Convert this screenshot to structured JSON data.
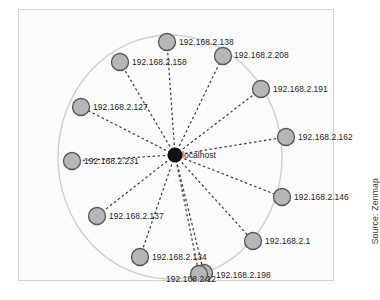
{
  "figure": {
    "type": "network-topology",
    "tool": "Zenmap",
    "source_note": "Source: Zenmap",
    "center": {
      "label": "localhost",
      "x": 157,
      "y": 146,
      "radius": 7.5,
      "color": "#111111"
    },
    "ring": {
      "center_x": 152,
      "center_y": 148,
      "radius_x": 112,
      "radius_y": 122,
      "stroke": "#cfcfcf"
    },
    "node_style": {
      "fill": "#b6b6b6",
      "stroke": "#555555",
      "radius": 8.5
    },
    "link_style": {
      "stroke": "#3a3a3a",
      "dash": "2.5,2.5",
      "width": 1.2
    },
    "hosts": [
      {
        "label": "192.168.2.138",
        "x": 149,
        "y": 33,
        "lx": 161,
        "ly": 29
      },
      {
        "label": "192.168.2.208",
        "x": 205,
        "y": 47,
        "lx": 216,
        "ly": 42
      },
      {
        "label": "192.168.2.191",
        "x": 243,
        "y": 80,
        "lx": 255,
        "ly": 76
      },
      {
        "label": "192.168.2.162",
        "x": 268,
        "y": 128,
        "lx": 280,
        "ly": 124
      },
      {
        "label": "192.168.2.146",
        "x": 264,
        "y": 188,
        "lx": 276,
        "ly": 184
      },
      {
        "label": "192.168.2.1",
        "x": 235,
        "y": 232,
        "lx": 247,
        "ly": 228
      },
      {
        "label": "192.168.2.198",
        "x": 186,
        "y": 264,
        "lx": 198,
        "ly": 262
      },
      {
        "label": "192.168.2.12",
        "x": 181,
        "y": 265,
        "lx": 148,
        "ly": 266
      },
      {
        "label": "192.168.2.134",
        "x": 122,
        "y": 248,
        "lx": 134,
        "ly": 244
      },
      {
        "label": "192.168.2.137",
        "x": 79,
        "y": 207,
        "lx": 91,
        "ly": 203
      },
      {
        "label": "192.168.2.231",
        "x": 54,
        "y": 152,
        "lx": 66,
        "ly": 148
      },
      {
        "label": "192.168.2.127",
        "x": 63,
        "y": 98,
        "lx": 75,
        "ly": 94
      },
      {
        "label": "192.168.2.158",
        "x": 102,
        "y": 53,
        "lx": 114,
        "ly": 49
      }
    ]
  }
}
